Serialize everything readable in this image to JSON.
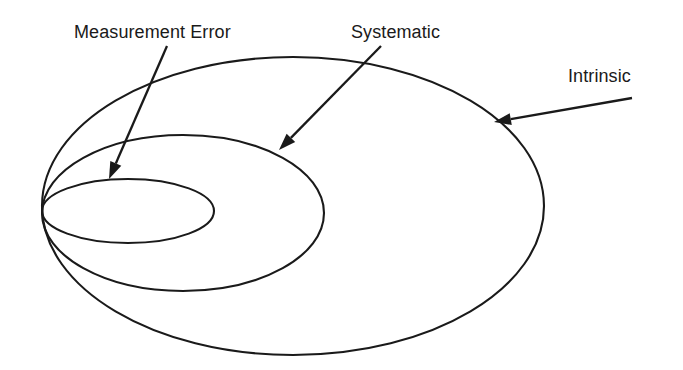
{
  "figure": {
    "kind": "nested-ellipse-venn-diagram",
    "background_color": "#ffffff",
    "stroke_color": "#1a1a1a",
    "stroke_width": 2.1,
    "width": 683,
    "height": 370
  },
  "labels": {
    "measurement_error": "Measurement Error",
    "systematic": "Systematic",
    "intrinsic": "Intrinsic"
  },
  "regions": [
    {
      "id": "intrinsic",
      "name": "Intrinsic",
      "nesting_level": 1,
      "cx": 293,
      "cy": 206,
      "rx": 252,
      "ry": 149
    },
    {
      "id": "systematic",
      "name": "Systematic",
      "nesting_level": 2,
      "cx": 183,
      "cy": 213,
      "rx": 141,
      "ry": 78
    },
    {
      "id": "measurement-error",
      "name": "Measurement Error",
      "nesting_level": 3,
      "cx": 128,
      "cy": 211,
      "rx": 86,
      "ry": 32
    }
  ],
  "tangent_point": {
    "x": 42,
    "y": 206,
    "note": "all three ellipses meet at this common left point"
  },
  "callouts": [
    {
      "id": "measurement-error-callout",
      "label": "Measurement Error",
      "text_x": 74,
      "text_y": 38,
      "line_from": {
        "x": 167,
        "y": 46
      },
      "line_to": {
        "x": 109,
        "y": 179
      }
    },
    {
      "id": "systematic-callout",
      "label": "Systematic",
      "text_x": 351,
      "text_y": 38,
      "line_from": {
        "x": 381,
        "y": 46
      },
      "line_to": {
        "x": 279,
        "y": 150
      }
    },
    {
      "id": "intrinsic-callout",
      "label": "Intrinsic",
      "text_x": 568,
      "text_y": 82,
      "line_from": {
        "x": 632,
        "y": 98
      },
      "line_to": {
        "x": 494,
        "y": 122
      }
    }
  ]
}
